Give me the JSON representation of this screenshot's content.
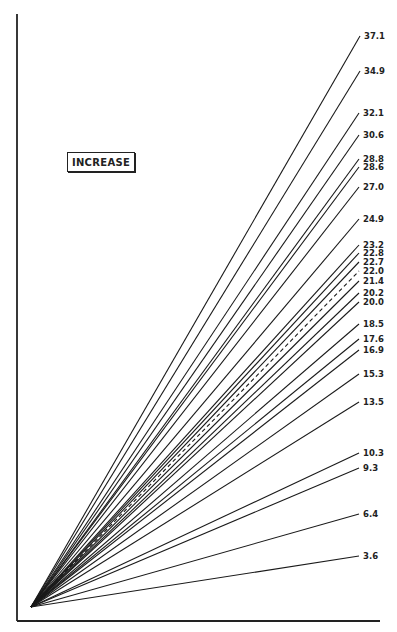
{
  "chart_data": {
    "type": "line",
    "title": "",
    "legend": [
      "INCREASE"
    ],
    "xlabel": "",
    "ylabel": "",
    "origin_px": [
      31,
      607
    ],
    "axes_px": {
      "left_x": 17,
      "top_y": 14,
      "bottom_y": 621,
      "right_x": 380
    },
    "series": [
      {
        "name": "37.1",
        "value": 37.1,
        "end_px": [
          360,
          36
        ],
        "dashed": false
      },
      {
        "name": "34.9",
        "value": 34.9,
        "end_px": [
          360,
          71
        ],
        "dashed": false
      },
      {
        "name": "32.1",
        "value": 32.1,
        "end_px": [
          359,
          113
        ],
        "dashed": false
      },
      {
        "name": "30.6",
        "value": 30.6,
        "end_px": [
          359,
          135
        ],
        "dashed": false
      },
      {
        "name": "28.8",
        "value": 28.8,
        "end_px": [
          359,
          159
        ],
        "dashed": false
      },
      {
        "name": "28.6",
        "value": 28.6,
        "end_px": [
          359,
          167
        ],
        "dashed": false
      },
      {
        "name": "27.0",
        "value": 27.0,
        "end_px": [
          359,
          187
        ],
        "dashed": false
      },
      {
        "name": "24.9",
        "value": 24.9,
        "end_px": [
          359,
          219
        ],
        "dashed": false
      },
      {
        "name": "23.2",
        "value": 23.2,
        "end_px": [
          359,
          245
        ],
        "dashed": false
      },
      {
        "name": "22.8",
        "value": 22.8,
        "end_px": [
          359,
          253
        ],
        "dashed": false
      },
      {
        "name": "22.7",
        "value": 22.7,
        "end_px": [
          359,
          262
        ],
        "dashed": false
      },
      {
        "name": "22.0",
        "value": 22.0,
        "end_px": [
          359,
          271
        ],
        "dashed": true
      },
      {
        "name": "21.4",
        "value": 21.4,
        "end_px": [
          359,
          281
        ],
        "dashed": false
      },
      {
        "name": "20.2",
        "value": 20.2,
        "end_px": [
          359,
          293
        ],
        "dashed": false
      },
      {
        "name": "20.0",
        "value": 20.0,
        "end_px": [
          359,
          302
        ],
        "dashed": false
      },
      {
        "name": "18.5",
        "value": 18.5,
        "end_px": [
          359,
          324
        ],
        "dashed": false
      },
      {
        "name": "17.6",
        "value": 17.6,
        "end_px": [
          359,
          339
        ],
        "dashed": false
      },
      {
        "name": "16.9",
        "value": 16.9,
        "end_px": [
          359,
          350
        ],
        "dashed": false
      },
      {
        "name": "15.3",
        "value": 15.3,
        "end_px": [
          359,
          374
        ],
        "dashed": false
      },
      {
        "name": "13.5",
        "value": 13.5,
        "end_px": [
          359,
          402
        ],
        "dashed": false
      },
      {
        "name": "10.3",
        "value": 10.3,
        "end_px": [
          359,
          453
        ],
        "dashed": false
      },
      {
        "name": "9.3",
        "value": 9.3,
        "end_px": [
          359,
          468
        ],
        "dashed": false
      },
      {
        "name": "6.4",
        "value": 6.4,
        "end_px": [
          359,
          514
        ],
        "dashed": false
      },
      {
        "name": "3.6",
        "value": 3.6,
        "end_px": [
          359,
          556
        ],
        "dashed": false
      }
    ]
  },
  "legend_label": "INCREASE"
}
